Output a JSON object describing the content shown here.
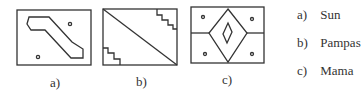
{
  "figures": [
    {
      "id": "a",
      "caption": "a)",
      "description": "rectangle with stepped diagonal band (escalator shape) and two small circles"
    },
    {
      "id": "b",
      "caption": "b)",
      "description": "rectangle split by diagonal line with stepped corner motifs"
    },
    {
      "id": "c",
      "caption": "c)",
      "description": "rectangle with nested diamonds, horizontal side lines and four small circles"
    }
  ],
  "legend": [
    {
      "key": "a)",
      "label": "Sun"
    },
    {
      "key": "b)",
      "label": "Pampas"
    },
    {
      "key": "c)",
      "label": "Mama"
    }
  ],
  "colors": {
    "stroke": "#333333",
    "background": "#ffffff"
  }
}
